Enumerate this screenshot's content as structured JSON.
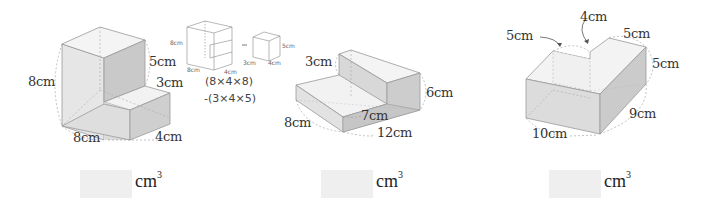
{
  "problems": [
    {
      "id": 1,
      "labels": {
        "height": "8cm",
        "upper_step": "5cm",
        "lower_step": "3cm",
        "width": "8cm",
        "depth": "4cm"
      },
      "hint": {
        "big_box_labels": {
          "height": "8cm",
          "width": "8cm",
          "depth": "4cm"
        },
        "minus_sign": "-",
        "small_box_labels": {
          "height": "5cm",
          "width": "3cm",
          "depth": "4cm"
        },
        "formula_line1": "(8×4×8)",
        "formula_line2": "-(3×4×5)"
      },
      "answer": {
        "value": "",
        "unit": "cm",
        "exponent": "3"
      }
    },
    {
      "id": 2,
      "labels": {
        "step_height": "3cm",
        "total_height": "6cm",
        "step_depth": "7cm",
        "width": "8cm",
        "length": "12cm"
      },
      "answer": {
        "value": "",
        "unit": "cm",
        "exponent": "3"
      }
    },
    {
      "id": 3,
      "labels": {
        "left_width": "5cm",
        "notch": "4cm",
        "right_width": "5cm",
        "height": "5cm",
        "depth": "9cm",
        "length": "10cm"
      },
      "answer": {
        "value": "",
        "unit": "cm",
        "exponent": "3"
      }
    }
  ]
}
